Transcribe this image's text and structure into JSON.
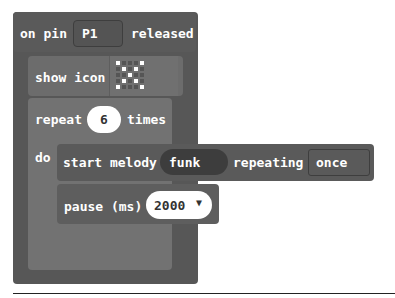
{
  "event_block": {
    "prefix": "on pin",
    "pin": "P1",
    "suffix": "released"
  },
  "show_icon_block": {
    "label": "show icon",
    "icon": "x-pattern-icon",
    "grid": [
      [
        1,
        0,
        0,
        0,
        1
      ],
      [
        0,
        1,
        0,
        1,
        0
      ],
      [
        0,
        0,
        1,
        0,
        0
      ],
      [
        0,
        1,
        0,
        1,
        0
      ],
      [
        1,
        0,
        0,
        0,
        1
      ]
    ]
  },
  "repeat_block": {
    "prefix": "repeat",
    "count": "6",
    "suffix": "times",
    "do_label": "do"
  },
  "melody_block": {
    "label": "start melody",
    "melody": "funk",
    "repeating_label": "repeating",
    "repeat_mode": "once"
  },
  "pause_block": {
    "label": "pause (ms)",
    "value": "2000",
    "dropdown_icon": "caret-down-icon"
  },
  "colors": {
    "event": "#575757",
    "show_icon": "#6c6c6c",
    "loop": "#727272",
    "music": "#5a5a5a"
  }
}
